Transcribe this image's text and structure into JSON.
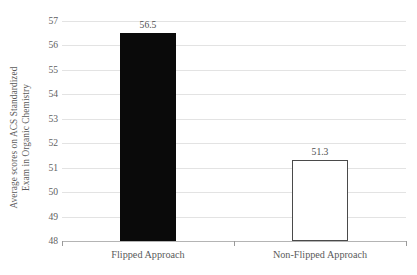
{
  "chart_data": {
    "type": "bar",
    "title": "",
    "xlabel": "",
    "ylabel": "Average scores on ACS Standardized\nExam in Organic Chemistry",
    "categories": [
      "Flipped Approach",
      "Non-Flipped Approach"
    ],
    "values": [
      56.5,
      51.3
    ],
    "value_labels": [
      "56.5",
      "51.3"
    ],
    "ylim": [
      48,
      57
    ],
    "yticks": [
      57,
      56,
      55,
      54,
      53,
      52,
      51,
      50,
      49,
      48
    ],
    "ytick_labels": [
      "57",
      "56",
      "55",
      "54",
      "53",
      "52",
      "51",
      "50",
      "49",
      "48"
    ],
    "grid": true,
    "legend": "none",
    "series": [
      {
        "name": "Average ACS score",
        "values": [
          56.5,
          51.3
        ],
        "styles": [
          "filled-black",
          "outlined-white"
        ]
      }
    ],
    "colors": {
      "bar_filled": "#0a0a0a",
      "bar_outline": "#4a4a4a",
      "bar_unfilled": "#ffffff",
      "gridline": "#e3e3e3",
      "axis": "#b4b4b4",
      "text": "#5a5a5a",
      "background": "#ffffff"
    }
  }
}
